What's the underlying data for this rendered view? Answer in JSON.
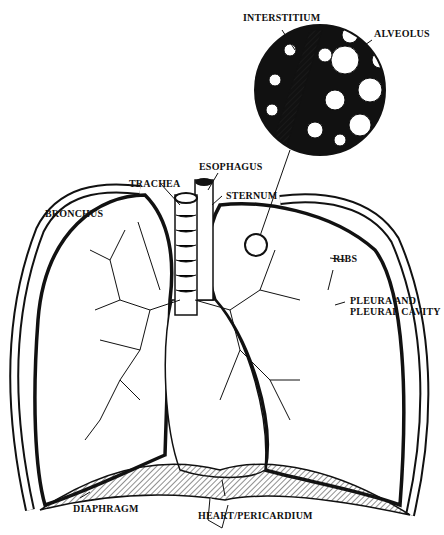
{
  "diagram": {
    "labels": {
      "interstitium": "INTERSTITIUM",
      "alveolus": "ALVEOLUS",
      "esophagus": "ESOPHAGUS",
      "trachea": "TRACHEA",
      "sternum": "STERNUM",
      "bronchus": "BRONCHUS",
      "ribs": "RIBS",
      "pleura_line1": "PLEURA AND",
      "pleura_line2": "PLEURAL CAVITY",
      "diaphragm": "DIAPHRAGM",
      "heart": "HEART/PERICARDIUM"
    },
    "colors": {
      "ink": "#111111",
      "paper": "#ffffff"
    }
  }
}
